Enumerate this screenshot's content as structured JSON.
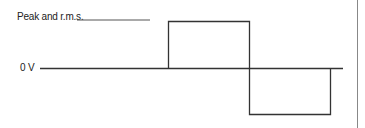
{
  "diagram": {
    "type": "square-wave",
    "labels": {
      "peak": "Peak and r.m.s.",
      "zero": "0 V"
    },
    "colors": {
      "stroke": "#333333",
      "border": "#888888",
      "background": "#ffffff"
    }
  }
}
